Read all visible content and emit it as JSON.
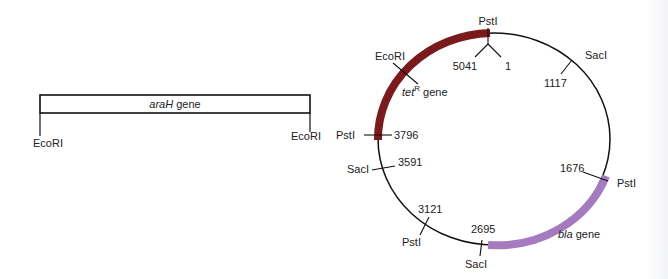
{
  "colors": {
    "tet_gene": "#7a1a1c",
    "bla_gene": "#a57bbf",
    "line": "#111111",
    "text": "#222222"
  },
  "linear_fragment": {
    "gene_name": "araH",
    "gene_suffix": " gene",
    "left_site": "EcoRI",
    "right_site": "EcoRI"
  },
  "plasmid": {
    "genes": [
      {
        "name": "tet",
        "superscript": "R",
        "suffix": " gene"
      },
      {
        "name": "bla",
        "suffix": " gene"
      }
    ],
    "origin": {
      "site": "PstI",
      "left_label": "5041",
      "right_label": "1"
    },
    "sites": [
      {
        "enzyme": "EcoRI",
        "position": ""
      },
      {
        "enzyme": "SacI",
        "position": "1117"
      },
      {
        "enzyme": "PstI",
        "position": "1676"
      },
      {
        "enzyme": "SacI",
        "position": "2695"
      },
      {
        "enzyme": "PstI",
        "position": "3121"
      },
      {
        "enzyme": "SacI",
        "position": "3591"
      },
      {
        "enzyme": "PstI",
        "position": "3796"
      }
    ]
  }
}
